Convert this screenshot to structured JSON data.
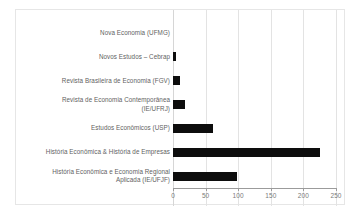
{
  "chart_data": {
    "type": "bar",
    "orientation": "horizontal",
    "title": "",
    "subtitle": "",
    "xlabel": "",
    "ylabel": "",
    "xlim": [
      0,
      250
    ],
    "xticks": [
      0,
      50,
      100,
      150,
      200,
      250
    ],
    "xtick_labels": [
      "0",
      "50",
      "100",
      "150",
      "200",
      "250"
    ],
    "grid": true,
    "grid_axis": "x",
    "legend": false,
    "legend_position": "none",
    "bar_color": "#0d0d0d",
    "categories": [
      "Nova Economia (UFMG)",
      "Novos Estudos – Cebrap",
      "Revista Brasileira de Economia (FGV)",
      "Revista de Economia Contemporânea\n(IE/UFRJ)",
      "Estudos Econômicos (USP)",
      "História Econômica & História de Empresas",
      "História Econômica e Economia Regional\nAplicada (IE/UFJF)"
    ],
    "values": [
      0,
      5,
      10,
      19,
      61,
      226,
      98
    ]
  },
  "axis": {
    "ticks": [
      {
        "label": "0",
        "value": 0
      },
      {
        "label": "50",
        "value": 50
      },
      {
        "label": "100",
        "value": 100
      },
      {
        "label": "150",
        "value": 150
      },
      {
        "label": "200",
        "value": 200
      },
      {
        "label": "250",
        "value": 250
      }
    ]
  },
  "rows": [
    {
      "label": "Nova Economia (UFMG)",
      "value": 0
    },
    {
      "label": "Novos Estudos – Cebrap",
      "value": 5
    },
    {
      "label": "Revista Brasileira de Economia (FGV)",
      "value": 10
    },
    {
      "label": "Revista de Economia Contemporânea\n(IE/UFRJ)",
      "value": 19
    },
    {
      "label": "Estudos Econômicos (USP)",
      "value": 61
    },
    {
      "label": "História Econômica & História de Empresas",
      "value": 226
    },
    {
      "label": "História Econômica e Economia Regional\nAplicada (IE/UFJF)",
      "value": 98
    }
  ],
  "colors": {
    "bar": "#0d0d0d",
    "grid": "#e3e3e3",
    "axis": "#9b9b9b",
    "frame": "#e6e6e6",
    "label_text": "#5f5f5f",
    "tick_text": "#7a7a7a",
    "background": "#ffffff"
  }
}
